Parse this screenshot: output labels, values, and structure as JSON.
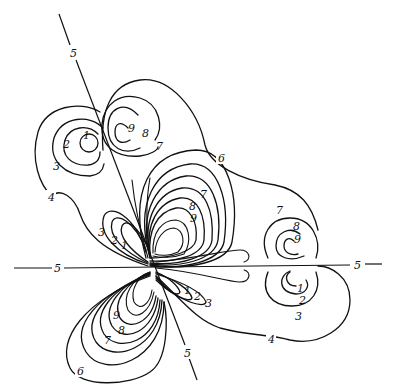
{
  "figure": {
    "type": "contour-diagram",
    "line_color": "#111111",
    "background": "#ffffff"
  },
  "labels": {
    "nodal_top": "5",
    "nodal_left": "5",
    "nodal_right": "5",
    "nodal_bottom": "5",
    "ul_1": "1",
    "ul_2": "2",
    "ul_3": "3",
    "ul_4": "4",
    "ur_9": "9",
    "ur_8": "8",
    "ur_7": "7",
    "top_6": "6",
    "c_up_7": "7",
    "c_up_8": "8",
    "c_up_9": "9",
    "c_left_3": "3",
    "c_left_2": "2",
    "c_left_1": "1",
    "c_right_1": "1",
    "c_right_2": "2",
    "c_right_3": "3",
    "c_low_9": "9",
    "c_low_8": "8",
    "c_low_7": "7",
    "c_low_6": "6",
    "r_up_7": "7",
    "r_up_8": "8",
    "r_up_9": "9",
    "r_low_1": "1",
    "r_low_2": "2",
    "r_low_3": "3",
    "bottom_4": "4"
  }
}
